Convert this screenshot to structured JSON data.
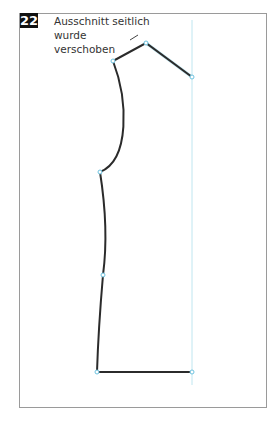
{
  "figure": {
    "number": "22",
    "caption_line1": "Ausschnitt seitlich wurde",
    "caption_line2": "verschoben"
  },
  "colors": {
    "outline": "#2b2b2b",
    "guide": "#a6dcea",
    "point": "#6ec3e0",
    "frame": "#9a9a9a"
  },
  "pattern_points": [
    {
      "name": "neck-left",
      "x": 113,
      "y": 61
    },
    {
      "name": "shoulder-apex",
      "x": 146,
      "y": 43
    },
    {
      "name": "shoulder-right",
      "x": 192,
      "y": 77
    },
    {
      "name": "armhole-bottom",
      "x": 100,
      "y": 172
    },
    {
      "name": "side-mid",
      "x": 103,
      "y": 275
    },
    {
      "name": "hem-left",
      "x": 97,
      "y": 372
    },
    {
      "name": "hem-right",
      "x": 192,
      "y": 372
    }
  ]
}
